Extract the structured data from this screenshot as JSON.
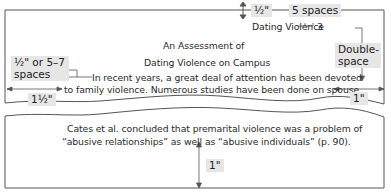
{
  "page_top": {
    "running_head": "Dating Violence",
    "page_number": "3",
    "title_line_1": "An Assessment of",
    "title_line_2": "Dating Violence on Campus",
    "body_line_1": "In recent years, a great deal of attention has been devoted",
    "body_line_2": "to family violence. Numerous studies have been done on spouse"
  },
  "page_bottom": {
    "body_line_1": "Cates et al. concluded that premarital violence was a problem of",
    "body_line_2": "“abusive relationships” as well as “abusive individuals” (p. 90)."
  },
  "annotations": {
    "top_margin": "½\"",
    "header_spacing": "5 spaces",
    "indent_line_1": "½\" or 5–7",
    "indent_line_2": "spaces",
    "double_space_line_1": "Double-",
    "double_space_line_2": "space",
    "left_margin": "1½\"",
    "right_margin": "1\"",
    "bottom_margin": "1\""
  },
  "colors": {
    "page_border": "#555555",
    "label_background": "#e6e6e6",
    "text": "#2a2a2a"
  }
}
